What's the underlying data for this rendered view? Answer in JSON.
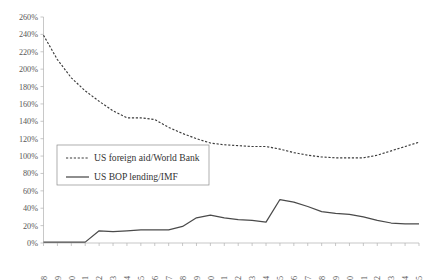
{
  "chart_data": {
    "type": "line",
    "title": "",
    "xlabel": "",
    "ylabel": "",
    "ylim": [
      0,
      260
    ],
    "ytick_step": 20,
    "grid": false,
    "legend_position": "inside-left-middle",
    "y_ticks": [
      "0%",
      "20%",
      "40%",
      "60%",
      "80%",
      "100%",
      "120%",
      "140%",
      "160%",
      "180%",
      "200%",
      "220%",
      "240%",
      "260%"
    ],
    "categories": [
      "1978",
      "1979",
      "1980",
      "1981",
      "1982",
      "1983",
      "1984",
      "1985",
      "1986",
      "1987",
      "1988",
      "1989",
      "1990",
      "1991",
      "1992",
      "1993",
      "1994",
      "1995",
      "1996",
      "1997",
      "1998",
      "1999",
      "2000",
      "2001",
      "2002",
      "2003",
      "2004",
      "2005"
    ],
    "series": [
      {
        "name": "US foreign aid/World Bank",
        "style": "dashed",
        "color": "#3b3b3b",
        "values": [
          239,
          211,
          190,
          175,
          163,
          152,
          144,
          144,
          142,
          133,
          126,
          120,
          115,
          113,
          112,
          111,
          111,
          108,
          104,
          101,
          99,
          98,
          98,
          98,
          101,
          106,
          111,
          116
        ]
      },
      {
        "name": "US BOP lending/IMF",
        "style": "solid",
        "color": "#4a4a4a",
        "values": [
          1,
          1,
          1,
          1,
          14,
          13,
          14,
          15,
          15,
          15,
          19,
          29,
          32,
          29,
          27,
          26,
          24,
          50,
          47,
          42,
          36,
          34,
          33,
          30,
          26,
          23,
          22,
          22
        ]
      }
    ]
  },
  "legend": {
    "entries": [
      {
        "label": "US foreign aid/World Bank",
        "style": "dashed"
      },
      {
        "label": "US BOP lending/IMF",
        "style": "solid"
      }
    ]
  }
}
